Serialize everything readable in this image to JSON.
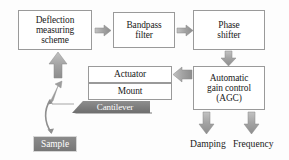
{
  "diagram": {
    "background_color": "#fdfdfd",
    "box_border_color": "#9a9a9a",
    "arrow_color": "#a8a8a8",
    "accent_gray": "#7c7c7c"
  },
  "blocks": {
    "deflection": {
      "line1": "Deflection",
      "line2": "measuring",
      "line3": "scheme"
    },
    "bandpass": {
      "line1": "Bandpass",
      "line2": "filter"
    },
    "phase": {
      "line1": "Phase",
      "line2": "shifter"
    },
    "agc": {
      "line1": "Automatic",
      "line2": "gain control",
      "line3": "(AGC)"
    },
    "actuator": {
      "label": "Actuator"
    },
    "mount": {
      "label": "Mount"
    },
    "cantilever": {
      "label": "Cantilever"
    },
    "sample": {
      "label": "Sample"
    }
  },
  "outputs": {
    "damping": {
      "label": "Damping"
    },
    "frequency": {
      "label": "Frequency"
    }
  },
  "arrows": [
    {
      "name": "deflection-to-bandpass",
      "direction": "right"
    },
    {
      "name": "bandpass-to-phase",
      "direction": "right"
    },
    {
      "name": "phase-to-agc",
      "direction": "down"
    },
    {
      "name": "agc-to-actuator",
      "direction": "left"
    },
    {
      "name": "cantilever-to-deflection",
      "direction": "up"
    },
    {
      "name": "tip-deflection-feedback",
      "direction": "up-right"
    },
    {
      "name": "tip-sample-interaction",
      "direction": "curved-double"
    },
    {
      "name": "agc-to-damping",
      "direction": "down"
    },
    {
      "name": "agc-to-frequency",
      "direction": "down"
    }
  ]
}
